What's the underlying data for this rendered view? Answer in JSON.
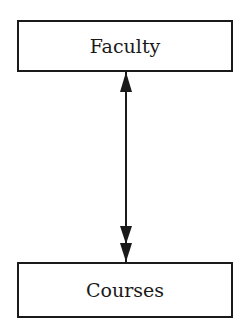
{
  "diagram": {
    "entities": [
      {
        "id": "faculty",
        "label": "Faculty"
      },
      {
        "id": "courses",
        "label": "Courses"
      }
    ],
    "relationships": [
      {
        "from": "faculty",
        "to": "courses",
        "from_end": "one",
        "to_end": "many",
        "style": "single-arrow to double-arrow"
      }
    ]
  },
  "colors": {
    "stroke": "#1a1a1a",
    "background": "#ffffff"
  }
}
